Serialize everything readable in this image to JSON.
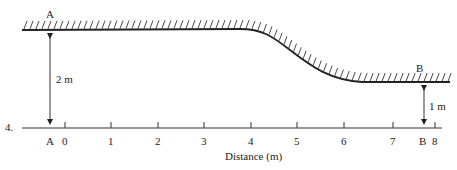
{
  "figure": {
    "number": "4.",
    "points": {
      "A_top": "A",
      "B_top": "B",
      "A_axis": "A",
      "B_axis": "B"
    },
    "heights": {
      "A": "2 m",
      "B": "1 m"
    },
    "axis": {
      "label": "Distance (m)",
      "ticks": [
        "0",
        "1",
        "2",
        "3",
        "4",
        "5",
        "6",
        "7",
        "8"
      ]
    }
  }
}
